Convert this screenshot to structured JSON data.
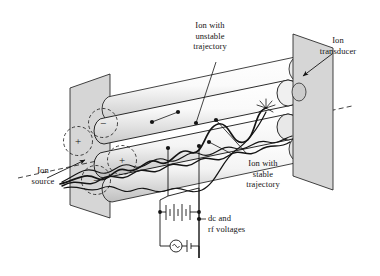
{
  "figure": {
    "type": "scientific-diagram",
    "background_color": "#ffffff",
    "ink_color": "#141414",
    "plate_fill": "#d6d6d6",
    "rod_fill": "#f2f2f2",
    "rod_shade": "#cfcfcf"
  },
  "labels": {
    "ion_source": {
      "line1": "Ion",
      "line2": "source"
    },
    "ion_transducer": {
      "line1": "Ion",
      "line2": "transducer"
    },
    "unstable": {
      "line1": "Ion with",
      "line2": "unstable",
      "line3": "trajectory"
    },
    "stable": {
      "line1": "Ion with",
      "line2": "stable",
      "line3": "trajectory"
    },
    "voltages": {
      "line1": "dc and",
      "line2": "rf voltages"
    }
  },
  "rod_polarity": {
    "top_rod_sign": "−",
    "left_rod_sign": "+",
    "bottom_rod_sign": "−",
    "right_rod_sign": "+",
    "signs": [
      "−",
      "+",
      "−",
      "+"
    ]
  },
  "circuit": {
    "dc_source": "battery-symbol",
    "rf_source": "ac-sine-source-symbol",
    "rf_bias": "battery-symbol-small"
  },
  "icons": {
    "collision_burst": "starburst-icon",
    "axis": "dashed-beam-axis",
    "arrow": "leader-arrow"
  }
}
